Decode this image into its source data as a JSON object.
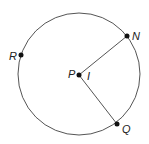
{
  "diagram": {
    "circle": {
      "center": "P",
      "stroke": "#555555"
    },
    "points": [
      {
        "label": "P",
        "role": "center"
      },
      {
        "label": "N",
        "role": "on-circle"
      },
      {
        "label": "Q",
        "role": "on-circle"
      },
      {
        "label": "R",
        "role": "on-circle"
      }
    ],
    "segments": [
      "PN",
      "PQ"
    ],
    "angle_label": "I"
  }
}
